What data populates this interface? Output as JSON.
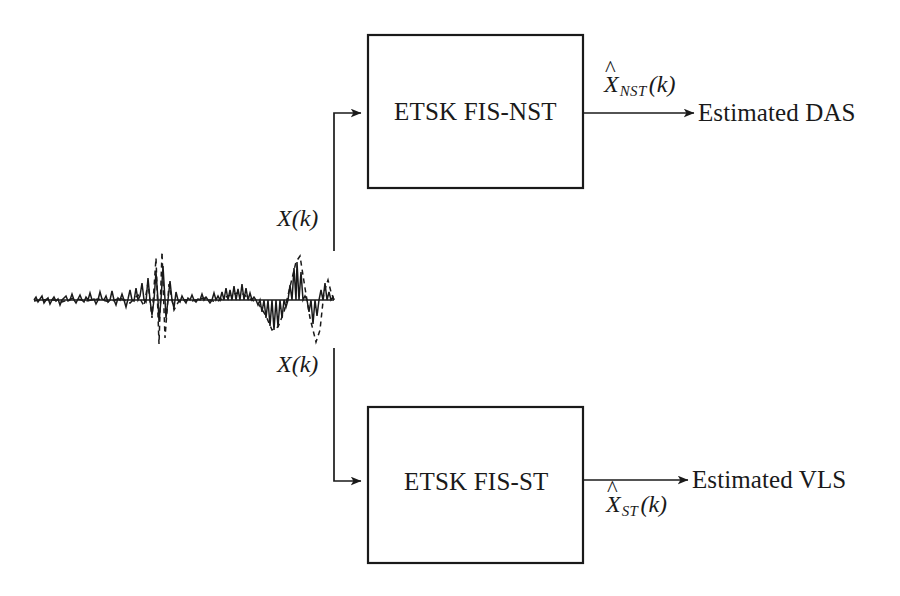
{
  "figure": {
    "type": "block-diagram",
    "background_color": "#ffffff",
    "stroke_color": "#1a1a1a",
    "canvas": {
      "width": 900,
      "height": 596
    }
  },
  "input_signal": {
    "name": "input-waveform",
    "description": "Noisy time-series waveform with two large transient spikes; solid trace overlaid with dashed trace",
    "traces": [
      {
        "style": "solid",
        "label": ""
      },
      {
        "style": "dashed",
        "label": ""
      }
    ],
    "bounds": {
      "x": 34,
      "y": 258,
      "width": 300,
      "height": 86
    },
    "baseline_y": 300
  },
  "branch_labels": {
    "top": "X(k)",
    "bottom": "X(k)",
    "variable": "X",
    "argument": "k"
  },
  "blocks": [
    {
      "id": "etsk-fis-nst",
      "label": "ETSK FIS-NST",
      "x": 368,
      "y": 35,
      "width": 215,
      "height": 153
    },
    {
      "id": "etsk-fis-st",
      "label": "ETSK FIS-ST",
      "x": 368,
      "y": 407,
      "width": 215,
      "height": 156
    }
  ],
  "outputs": [
    {
      "id": "output-nst",
      "signal_base": "X",
      "signal_subscript": "NST",
      "signal_argument": "(k)",
      "signal_full": "X̂NST(k)",
      "destination": "Estimated DAS",
      "label_position": "above-arrow"
    },
    {
      "id": "output-st",
      "signal_base": "X",
      "signal_subscript": "ST",
      "signal_argument": "(k)",
      "signal_full": "X̂ST(k)",
      "destination": "Estimated VLS",
      "label_position": "below-arrow"
    }
  ],
  "connections": [
    {
      "from": "input-waveform",
      "to": "etsk-fis-nst",
      "path": "up-then-right",
      "arrowhead": true
    },
    {
      "from": "input-waveform",
      "to": "etsk-fis-st",
      "path": "down-then-right",
      "arrowhead": true
    },
    {
      "from": "etsk-fis-nst",
      "to": "Estimated DAS",
      "path": "right",
      "arrowhead": true
    },
    {
      "from": "etsk-fis-st",
      "to": "Estimated VLS",
      "path": "right",
      "arrowhead": true
    }
  ]
}
